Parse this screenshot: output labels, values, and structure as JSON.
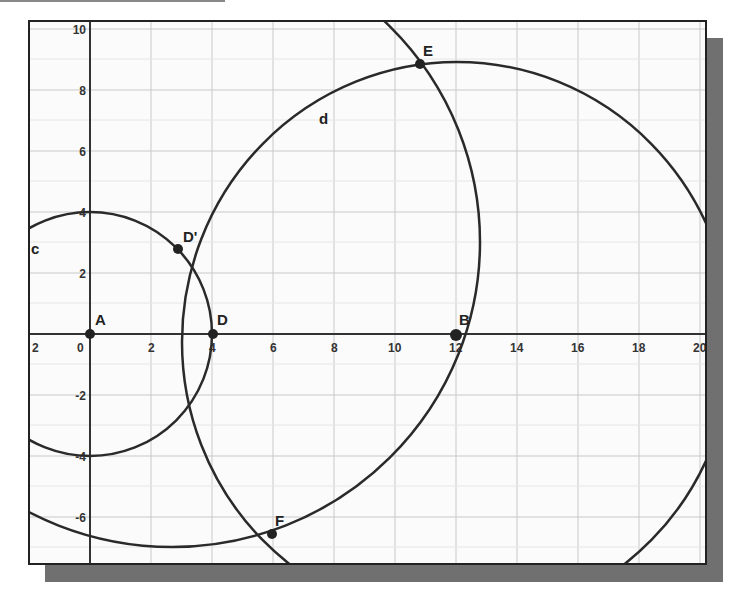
{
  "diagram": {
    "type": "geometry-construction",
    "grid": {
      "x_range": [
        -2,
        20
      ],
      "y_range": [
        -7,
        10
      ],
      "major_step": 2
    },
    "x_ticks": [
      "2",
      "0",
      "2",
      "4",
      "6",
      "8",
      "10",
      "12",
      "14",
      "16",
      "18",
      "20"
    ],
    "y_ticks": [
      "10",
      "8",
      "6",
      "4",
      "2",
      "-2",
      "-4",
      "-6"
    ],
    "points": [
      {
        "name": "A",
        "x": 0,
        "y": 0
      },
      {
        "name": "B",
        "x": 12,
        "y": 0
      },
      {
        "name": "D",
        "x": 4,
        "y": 0
      },
      {
        "name": "D'",
        "x": 2.9,
        "y": 2.8
      },
      {
        "name": "E",
        "x": 10.8,
        "y": 8.8
      },
      {
        "name": "F",
        "x": 5.9,
        "y": -6.6
      }
    ],
    "curves": [
      {
        "name": "c",
        "kind": "circle",
        "center": "A",
        "radius": 4
      },
      {
        "name": "d",
        "kind": "circle",
        "through": [
          "E",
          "F"
        ]
      },
      {
        "name": "",
        "kind": "circle",
        "through": [
          "E",
          "F"
        ]
      }
    ],
    "colors": {
      "stroke": "#2a2a2a",
      "grid": "#c8c8c8",
      "shadow": "#707070"
    }
  }
}
